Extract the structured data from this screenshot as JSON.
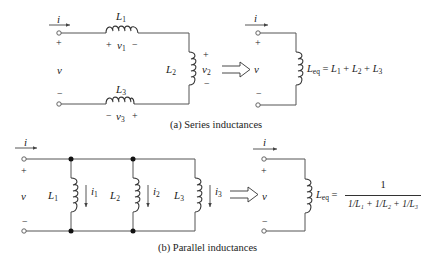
{
  "figure": {
    "series": {
      "caption": "(a) Series inductances",
      "current_label": "i",
      "voltage_label": "v",
      "plus": "+",
      "minus": "−",
      "inductors": [
        {
          "name": "L",
          "sub": "1",
          "voltage": "v",
          "voltage_sub": "1",
          "polarity_left": "+",
          "polarity_right": "−"
        },
        {
          "name": "L",
          "sub": "2",
          "voltage": "v",
          "voltage_sub": "2",
          "polarity_top": "+",
          "polarity_bottom": "−"
        },
        {
          "name": "L",
          "sub": "3",
          "voltage": "v",
          "voltage_sub": "3",
          "polarity_left": "−",
          "polarity_right": "+"
        }
      ],
      "equivalent": {
        "current_label": "i",
        "voltage_label": "v",
        "lhs": "L",
        "lhs_sub": "eq",
        "formula": "= L₁ + L₂ + L₃",
        "terms": [
          {
            "sym": "L",
            "sub": "1"
          },
          {
            "sym": "L",
            "sub": "2"
          },
          {
            "sym": "L",
            "sub": "3"
          }
        ]
      }
    },
    "parallel": {
      "caption": "(b) Parallel inductances",
      "current_label": "i",
      "voltage_label": "v",
      "plus": "+",
      "minus": "−",
      "inductors": [
        {
          "name": "L",
          "sub": "1",
          "current": "i",
          "current_sub": "1"
        },
        {
          "name": "L",
          "sub": "2",
          "current": "i",
          "current_sub": "2"
        },
        {
          "name": "L",
          "sub": "3",
          "current": "i",
          "current_sub": "3"
        }
      ],
      "equivalent": {
        "current_label": "i",
        "voltage_label": "v",
        "lhs": "L",
        "lhs_sub": "eq",
        "numerator": "1",
        "denominator": "1/L₁ + 1/L₂ + 1/L₃"
      }
    },
    "implies_symbol": "⟹",
    "colors": {
      "wire": "#555555",
      "text": "#222222",
      "background": "#ffffff"
    }
  }
}
